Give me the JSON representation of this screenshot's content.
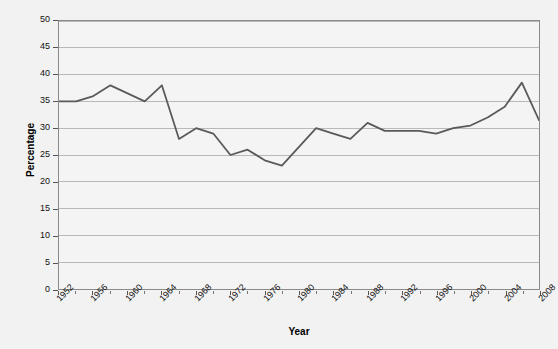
{
  "chart_data": {
    "type": "line",
    "title": "",
    "xlabel": "Year",
    "ylabel": "Percentage",
    "xlim": [
      1952,
      2008
    ],
    "ylim": [
      0,
      50
    ],
    "ytick_step": 5,
    "xtick_step": 4,
    "x_minor_step": 2,
    "grid": "horizontal",
    "legend": "none",
    "line_color": "#5a5a5a",
    "x": [
      1952,
      1954,
      1956,
      1958,
      1960,
      1962,
      1964,
      1966,
      1968,
      1970,
      1972,
      1974,
      1976,
      1978,
      1980,
      1982,
      1984,
      1986,
      1988,
      1990,
      1992,
      1994,
      1996,
      1998,
      2000,
      2002,
      2004,
      2006,
      2008
    ],
    "values": [
      35.0,
      35.0,
      36.0,
      38.0,
      36.5,
      35.0,
      38.0,
      28.0,
      30.0,
      29.0,
      25.0,
      26.0,
      24.0,
      23.0,
      26.5,
      30.0,
      29.0,
      28.0,
      31.0,
      29.5,
      29.5,
      29.5,
      29.0,
      30.0,
      30.5,
      32.0,
      34.0,
      38.5,
      31.5
    ],
    "ytick_labels": [
      "0",
      "5",
      "10",
      "15",
      "20",
      "25",
      "30",
      "35",
      "40",
      "45",
      "50"
    ],
    "xtick_labels": [
      "1952",
      "1956",
      "1960",
      "1964",
      "1968",
      "1972",
      "1976",
      "1980",
      "1984",
      "1988",
      "1992",
      "1996",
      "2000",
      "2004",
      "2008"
    ]
  },
  "axis": {
    "x_title": "Year",
    "y_title": "Percentage"
  }
}
